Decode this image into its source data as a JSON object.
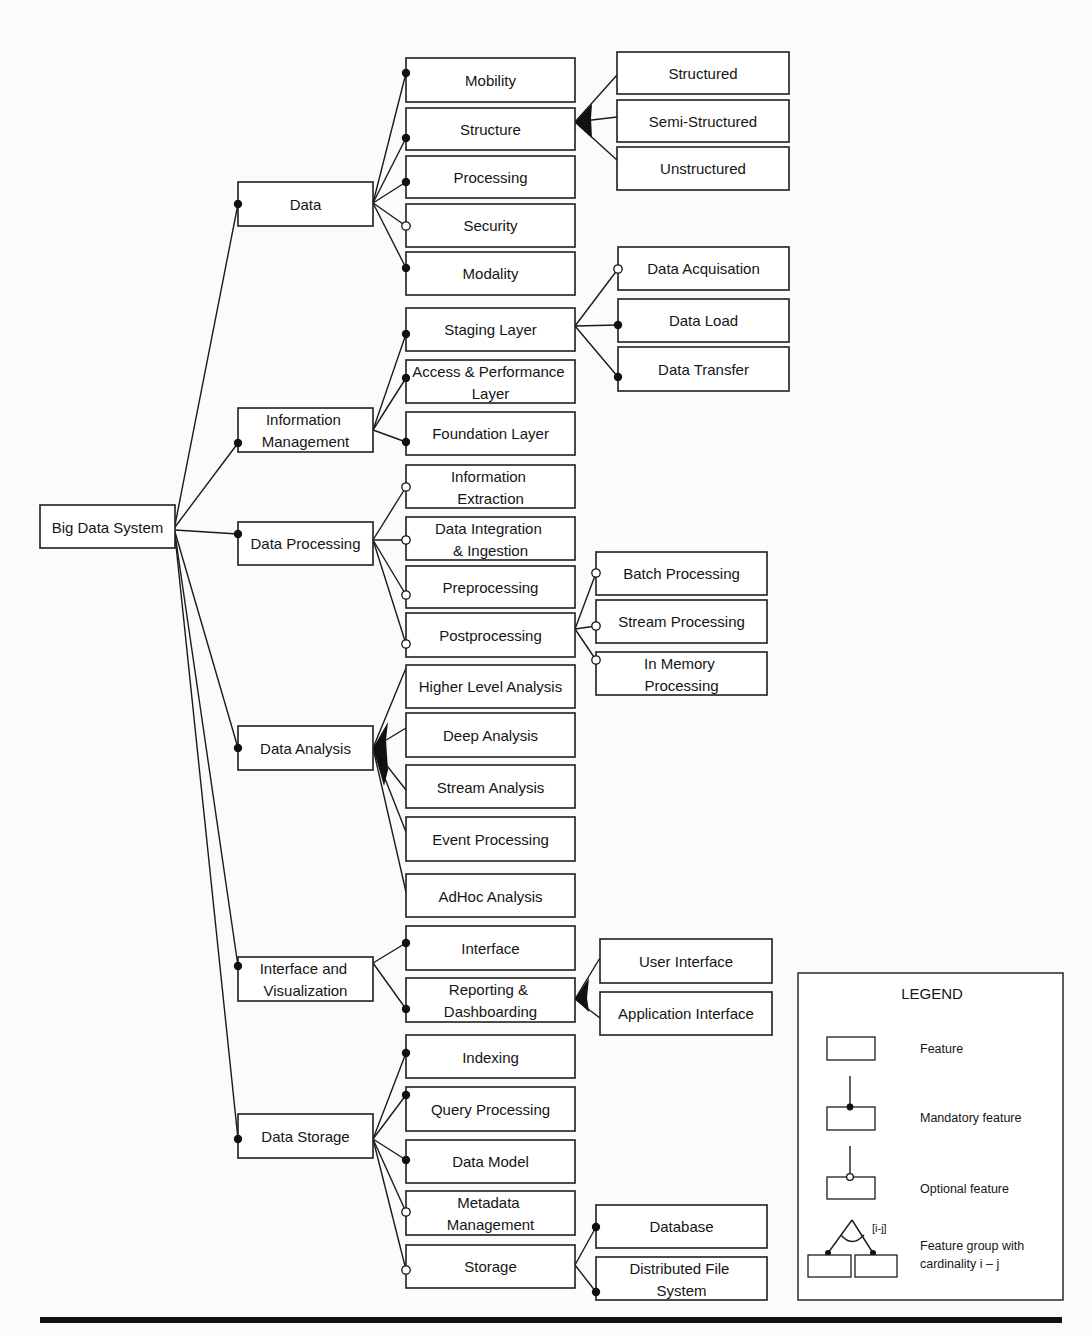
{
  "colors": {
    "line": "#111111",
    "box_fill": "#ffffff",
    "background": "#fbfbfa"
  },
  "tree": {
    "label": [
      "Big Data System"
    ],
    "children": [
      {
        "label": [
          "Data"
        ],
        "type": "mandatory",
        "children": [
          {
            "label": [
              "Mobility"
            ],
            "type": "mandatory"
          },
          {
            "label": [
              "Structure"
            ],
            "type": "mandatory",
            "group": "or",
            "children": [
              {
                "label": [
                  "Structured"
                ]
              },
              {
                "label": [
                  "Semi-Structured"
                ]
              },
              {
                "label": [
                  "Unstructured"
                ]
              }
            ]
          },
          {
            "label": [
              "Processing"
            ],
            "type": "mandatory"
          },
          {
            "label": [
              "Security"
            ],
            "type": "optional"
          },
          {
            "label": [
              "Modality"
            ],
            "type": "mandatory"
          }
        ]
      },
      {
        "label": [
          "Information",
          "Management"
        ],
        "type": "mandatory",
        "children": [
          {
            "label": [
              "Staging Layer"
            ],
            "type": "mandatory",
            "children": [
              {
                "label": [
                  "Data Acquisation"
                ],
                "type": "optional"
              },
              {
                "label": [
                  "Data Load"
                ],
                "type": "mandatory"
              },
              {
                "label": [
                  "Data Transfer"
                ],
                "type": "mandatory"
              }
            ]
          },
          {
            "label": [
              "Access & Performance",
              "Layer"
            ],
            "type": "mandatory"
          },
          {
            "label": [
              "Foundation Layer"
            ],
            "type": "mandatory"
          }
        ]
      },
      {
        "label": [
          "Data Processing"
        ],
        "type": "mandatory",
        "children": [
          {
            "label": [
              "Information",
              "Extraction"
            ],
            "type": "optional"
          },
          {
            "label": [
              "Data Integration",
              "& Ingestion"
            ],
            "type": "optional"
          },
          {
            "label": [
              "Preprocessing"
            ],
            "type": "optional"
          },
          {
            "label": [
              "Postprocessing"
            ],
            "type": "optional",
            "children": [
              {
                "label": [
                  "Batch Processing"
                ],
                "type": "optional"
              },
              {
                "label": [
                  "Stream Processing"
                ],
                "type": "optional"
              },
              {
                "label": [
                  "In Memory",
                  "Processing"
                ],
                "type": "optional"
              }
            ]
          }
        ]
      },
      {
        "label": [
          "Data Analysis"
        ],
        "type": "mandatory",
        "group": "or",
        "children": [
          {
            "label": [
              "Higher Level Analysis"
            ]
          },
          {
            "label": [
              "Deep Analysis"
            ]
          },
          {
            "label": [
              "Stream Analysis"
            ]
          },
          {
            "label": [
              "Event Processing"
            ]
          },
          {
            "label": [
              "AdHoc Analysis"
            ]
          }
        ]
      },
      {
        "label": [
          "Interface and",
          "Visualization"
        ],
        "type": "mandatory",
        "children": [
          {
            "label": [
              "Interface"
            ],
            "type": "mandatory"
          },
          {
            "label": [
              "Reporting &",
              "Dashboarding"
            ],
            "type": "mandatory",
            "group": "or",
            "children": [
              {
                "label": [
                  "User Interface"
                ]
              },
              {
                "label": [
                  "Application Interface"
                ]
              }
            ]
          }
        ]
      },
      {
        "label": [
          "Data Storage"
        ],
        "type": "mandatory",
        "children": [
          {
            "label": [
              "Indexing"
            ],
            "type": "mandatory"
          },
          {
            "label": [
              "Query Processing"
            ],
            "type": "mandatory"
          },
          {
            "label": [
              "Data Model"
            ],
            "type": "mandatory"
          },
          {
            "label": [
              "Metadata",
              "Management"
            ],
            "type": "optional"
          },
          {
            "label": [
              "Storage"
            ],
            "type": "optional",
            "children": [
              {
                "label": [
                  "Database"
                ],
                "type": "mandatory"
              },
              {
                "label": [
                  "Distributed File",
                  "System"
                ],
                "type": "mandatory"
              }
            ]
          }
        ]
      }
    ]
  },
  "legend": {
    "title": "LEGEND",
    "items": [
      {
        "symbol": "feature-box",
        "label": [
          "Feature"
        ]
      },
      {
        "symbol": "mandatory",
        "label": [
          "Mandatory feature"
        ]
      },
      {
        "symbol": "optional",
        "label": [
          "Optional feature"
        ]
      },
      {
        "symbol": "group",
        "cardinality": "[i-j]",
        "label": [
          "Feature group with",
          "cardinality i – j"
        ]
      }
    ]
  }
}
